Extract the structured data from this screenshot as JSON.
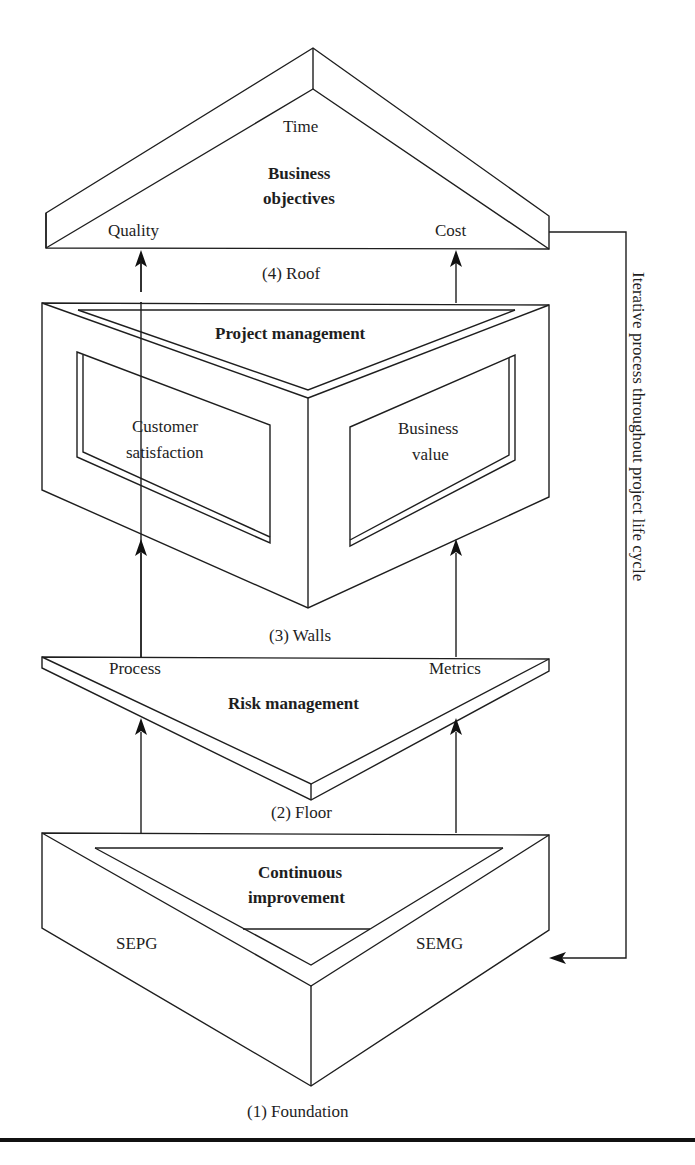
{
  "diagram": {
    "roof": {
      "level_label": "(4) Roof",
      "title": "Business objectives",
      "title_line1": "Business",
      "title_line2": "objectives",
      "apex_label": "Time",
      "left_label": "Quality",
      "right_label": "Cost"
    },
    "walls": {
      "level_label": "(3) Walls",
      "title": "Project management",
      "left_window_line1": "Customer",
      "left_window_line2": "satisfaction",
      "right_window_line1": "Business",
      "right_window_line2": "value"
    },
    "floor": {
      "level_label": "(2) Floor",
      "title": "Risk management",
      "left_label": "Process",
      "right_label": "Metrics"
    },
    "foundation": {
      "level_label": "(1) Foundation",
      "title_line1": "Continuous",
      "title_line2": "improvement",
      "left_label": "SEPG",
      "right_label": "SEMG"
    },
    "feedback_loop": {
      "label": "Iterative process throughout project life cycle"
    },
    "colors": {
      "line": "#1e1e1e",
      "background": "#ffffff"
    }
  }
}
